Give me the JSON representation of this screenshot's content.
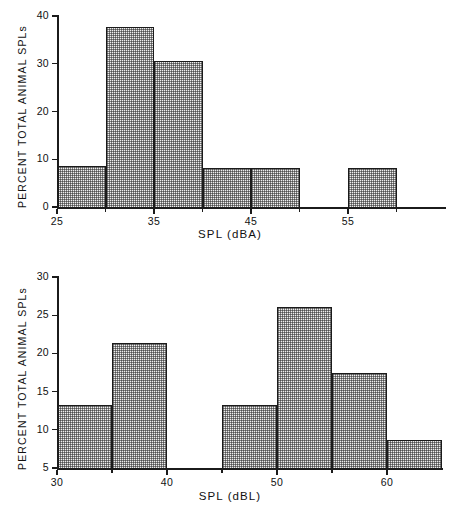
{
  "figure": {
    "background": "#ffffff",
    "ink_color": "#1b1b1b",
    "bar_fill": "#eeeeee"
  },
  "chart_data": [
    {
      "id": "spl-dba-histogram",
      "type": "bar",
      "title": "",
      "subtitle": "",
      "xlabel": "SPL (dBA)",
      "ylabel": "PERCENT TOTAL ANIMAL SPLs",
      "grid": false,
      "legend": false,
      "xlim": [
        25,
        65
      ],
      "ylim": [
        0,
        40
      ],
      "xticks": [
        25,
        35,
        45,
        55
      ],
      "xtick_labels": [
        "25",
        "35",
        "45",
        "55"
      ],
      "yticks": [
        0,
        10,
        20,
        30,
        40
      ],
      "ytick_labels": [
        "0",
        "10",
        "20",
        "30",
        "40"
      ],
      "bin_width": 5,
      "bin_edges": [
        25,
        30,
        35,
        40,
        45,
        50,
        55,
        60,
        65
      ],
      "bins": [
        {
          "range": "25-30",
          "x0": 25,
          "x1": 30,
          "value": 8.6
        },
        {
          "range": "30-35",
          "x0": 30,
          "x1": 35,
          "value": 37.8
        },
        {
          "range": "35-40",
          "x0": 35,
          "x1": 40,
          "value": 30.5
        },
        {
          "range": "40-45",
          "x0": 40,
          "x1": 45,
          "value": 8.2
        },
        {
          "range": "45-50",
          "x0": 45,
          "x1": 50,
          "value": 8.2
        },
        {
          "range": "50-55",
          "x0": 50,
          "x1": 55,
          "value": 0
        },
        {
          "range": "55-60",
          "x0": 55,
          "x1": 60,
          "value": 8.2
        },
        {
          "range": "60-65",
          "x0": 60,
          "x1": 65,
          "value": 0
        }
      ],
      "categories": [
        "25-30",
        "30-35",
        "35-40",
        "40-45",
        "45-50",
        "50-55",
        "55-60",
        "60-65"
      ],
      "values": [
        8.6,
        37.8,
        30.5,
        8.2,
        8.2,
        0,
        8.2,
        0
      ]
    },
    {
      "id": "spl-dbl-histogram",
      "type": "bar",
      "title": "",
      "subtitle": "",
      "xlabel": "SPL (dBL)",
      "ylabel": "PERCENT TOTAL ANIMAL SPLs",
      "grid": false,
      "legend": false,
      "xlim": [
        30,
        65
      ],
      "ylim": [
        5,
        30
      ],
      "xticks": [
        30,
        40,
        50,
        60
      ],
      "xtick_labels": [
        "30",
        "40",
        "50",
        "60"
      ],
      "yticks": [
        5,
        10,
        15,
        20,
        25,
        30
      ],
      "ytick_labels": [
        "5",
        "10",
        "15",
        "20",
        "25",
        "30"
      ],
      "bin_width": 5,
      "bin_edges": [
        30,
        35,
        40,
        45,
        50,
        55,
        60,
        65
      ],
      "bins": [
        {
          "range": "30-35",
          "x0": 30,
          "x1": 35,
          "value": 13.2
        },
        {
          "range": "35-40",
          "x0": 35,
          "x1": 40,
          "value": 21.3
        },
        {
          "range": "40-45",
          "x0": 40,
          "x1": 45,
          "value": 5.0
        },
        {
          "range": "45-50",
          "x0": 45,
          "x1": 50,
          "value": 13.2
        },
        {
          "range": "50-55",
          "x0": 50,
          "x1": 55,
          "value": 26.1
        },
        {
          "range": "55-60",
          "x0": 55,
          "x1": 60,
          "value": 17.5
        },
        {
          "range": "60-65",
          "x0": 60,
          "x1": 65,
          "value": 8.6
        }
      ],
      "categories": [
        "30-35",
        "35-40",
        "40-45",
        "45-50",
        "50-55",
        "55-60",
        "60-65"
      ],
      "values": [
        13.2,
        21.3,
        5.0,
        13.2,
        26.1,
        17.5,
        8.6
      ]
    }
  ]
}
